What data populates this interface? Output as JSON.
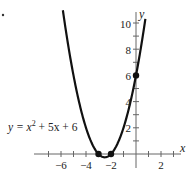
{
  "chart_data": {
    "type": "line",
    "title": "",
    "function": "y = x^2 + 5x + 6",
    "xlabel": "x",
    "ylabel": "y",
    "xlim": [
      -7.5,
      3.2
    ],
    "ylim": [
      -0.3,
      11
    ],
    "x_ticks": [
      -7,
      -6,
      -5,
      -4,
      -3,
      -2,
      -1,
      1,
      2,
      3
    ],
    "x_tick_labels": [
      "-6",
      "-4",
      "-2",
      "2"
    ],
    "x_tick_label_values": [
      -6,
      -4,
      -2,
      2
    ],
    "y_ticks": [
      1,
      2,
      3,
      4,
      5,
      6,
      7,
      8,
      9,
      10
    ],
    "y_tick_labels": [
      "2",
      "4",
      "6",
      "8",
      "10"
    ],
    "y_tick_label_values": [
      2,
      4,
      6,
      8,
      10
    ],
    "grid": false,
    "series": [
      {
        "name": "y = x^2 + 5x + 6",
        "x": [
          -6.2,
          -6,
          -5,
          -4,
          -3,
          -2.5,
          -2,
          -1,
          0,
          0.6
        ],
        "y": [
          13.44,
          12,
          6,
          2,
          0,
          -0.25,
          0,
          2,
          6,
          9.36
        ]
      }
    ],
    "marked_points": [
      {
        "x": -3,
        "y": 0,
        "label": "x-intercept"
      },
      {
        "x": -2,
        "y": 0,
        "label": "x-intercept"
      },
      {
        "x": 0,
        "y": 6,
        "label": "y-intercept"
      }
    ],
    "annotations": [
      {
        "text": "y = x² + 5x + 6",
        "x": -7.4,
        "y": 2.2
      }
    ]
  },
  "labels": {
    "x_axis": "x",
    "y_axis": "y",
    "equation_prefix": "y = x",
    "equation_exp": "2",
    "equation_suffix": " + 5x + 6",
    "tick_x": [
      "−6",
      "−4",
      "−2",
      "2"
    ],
    "tick_y": [
      "2",
      "4",
      "6",
      "8",
      "10"
    ],
    "bullet": "•"
  }
}
